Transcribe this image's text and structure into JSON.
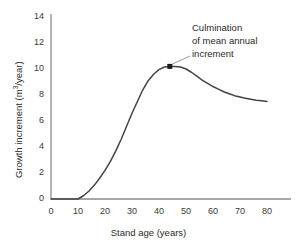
{
  "chart_data": {
    "type": "line",
    "title": "",
    "xlabel": "Stand age (years)",
    "ylabel": "Growth increment (m3/year)",
    "ylabel_prefix": "Growth increment (m",
    "ylabel_sup": "3",
    "ylabel_suffix": "/year)",
    "xlim": [
      0,
      80
    ],
    "ylim": [
      0,
      14
    ],
    "xticks": [
      0,
      10,
      20,
      30,
      40,
      50,
      60,
      70,
      80
    ],
    "yticks": [
      0,
      2,
      4,
      6,
      8,
      10,
      12,
      14
    ],
    "grid": false,
    "legend": false,
    "line_color": "#444444",
    "axis_color": "#8a8a8a",
    "x": [
      0,
      5,
      10,
      12,
      14,
      16,
      18,
      20,
      22,
      24,
      26,
      28,
      30,
      32,
      34,
      36,
      38,
      40,
      42,
      44,
      46,
      48,
      50,
      52,
      54,
      56,
      58,
      60,
      62,
      64,
      66,
      68,
      70,
      72,
      74,
      76,
      78,
      80
    ],
    "values": [
      0,
      0,
      0,
      0.25,
      0.6,
      1.05,
      1.6,
      2.2,
      2.9,
      3.7,
      4.6,
      5.6,
      6.6,
      7.5,
      8.4,
      9.1,
      9.6,
      9.95,
      10.15,
      10.2,
      10.2,
      10.15,
      10.0,
      9.75,
      9.45,
      9.15,
      8.9,
      8.65,
      8.45,
      8.25,
      8.1,
      7.95,
      7.85,
      7.75,
      7.68,
      7.6,
      7.55,
      7.5
    ],
    "annotations": [
      {
        "text_lines": [
          "Culmination",
          "of mean annual",
          "increment"
        ],
        "point_x": 44,
        "point_y": 10.2,
        "marker": "square"
      }
    ]
  }
}
